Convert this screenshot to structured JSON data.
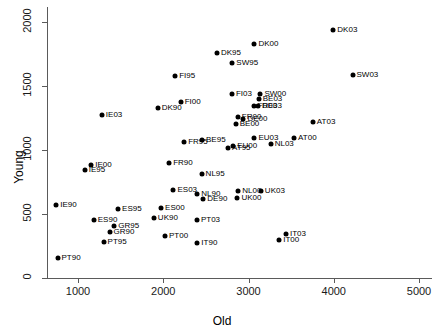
{
  "chart_data": {
    "type": "scatter",
    "title": "",
    "xlabel": "Old",
    "ylabel": "Young",
    "xlim": [
      500,
      5150
    ],
    "ylim": [
      -80,
      2120
    ],
    "grid": false,
    "legend": "none",
    "xticks": [
      1000,
      2000,
      3000,
      4000,
      5000
    ],
    "xticklabels": [
      "1000",
      "2000",
      "3000",
      "4000",
      "5000"
    ],
    "yticks": [
      0,
      500,
      1000,
      1500,
      2000
    ],
    "yticklabels": [
      "0",
      "500",
      "1000",
      "1500",
      "2000"
    ],
    "point_labels_position": "right",
    "points": [
      {
        "label": "PT90",
        "x": 760,
        "y": 160
      },
      {
        "label": "PT95",
        "x": 1300,
        "y": 280
      },
      {
        "label": "PT00",
        "x": 2020,
        "y": 330
      },
      {
        "label": "PT03",
        "x": 2395,
        "y": 455
      },
      {
        "label": "GR90",
        "x": 1370,
        "y": 360
      },
      {
        "label": "GR95",
        "x": 1425,
        "y": 405
      },
      {
        "label": "ES90",
        "x": 1185,
        "y": 455
      },
      {
        "label": "ES95",
        "x": 1470,
        "y": 540
      },
      {
        "label": "ES00",
        "x": 1975,
        "y": 545
      },
      {
        "label": "ES03",
        "x": 2120,
        "y": 690
      },
      {
        "label": "IE90",
        "x": 745,
        "y": 570
      },
      {
        "label": "IE95",
        "x": 1080,
        "y": 840
      },
      {
        "label": "IE00",
        "x": 1155,
        "y": 885
      },
      {
        "label": "IE03",
        "x": 1280,
        "y": 1270
      },
      {
        "label": "UK90",
        "x": 1890,
        "y": 470
      },
      {
        "label": "UK00",
        "x": 2870,
        "y": 625
      },
      {
        "label": "UK03",
        "x": 3145,
        "y": 680
      },
      {
        "label": "NL00",
        "x": 2880,
        "y": 680
      },
      {
        "label": "NL90",
        "x": 2400,
        "y": 660
      },
      {
        "label": "NL95",
        "x": 2450,
        "y": 810
      },
      {
        "label": "NL03",
        "x": 3260,
        "y": 1045
      },
      {
        "label": "DE90",
        "x": 2470,
        "y": 620
      },
      {
        "label": "DE00",
        "x": 2940,
        "y": 1245
      },
      {
        "label": "DE03",
        "x": 3110,
        "y": 1340
      },
      {
        "label": "BE00",
        "x": 2850,
        "y": 1205
      },
      {
        "label": "BE03",
        "x": 3120,
        "y": 1400
      },
      {
        "label": "FR90",
        "x": 2070,
        "y": 900
      },
      {
        "label": "FR95",
        "x": 2245,
        "y": 1065
      },
      {
        "label": "FR00",
        "x": 2875,
        "y": 1255
      },
      {
        "label": "FR03",
        "x": 3060,
        "y": 1345
      },
      {
        "label": "AT95",
        "x": 2760,
        "y": 1015
      },
      {
        "label": "AT00",
        "x": 3535,
        "y": 1090
      },
      {
        "label": "AT03",
        "x": 3755,
        "y": 1215
      },
      {
        "label": "EU00",
        "x": 2820,
        "y": 1035
      },
      {
        "label": "EU03",
        "x": 3070,
        "y": 1090
      },
      {
        "label": "IT90",
        "x": 2400,
        "y": 270
      },
      {
        "label": "IT00",
        "x": 3360,
        "y": 300
      },
      {
        "label": "IT03",
        "x": 3440,
        "y": 345
      },
      {
        "label": "FI00",
        "x": 2205,
        "y": 1375
      },
      {
        "label": "FI03",
        "x": 2805,
        "y": 1435
      },
      {
        "label": "FI95",
        "x": 2140,
        "y": 1580
      },
      {
        "label": "SW95",
        "x": 2810,
        "y": 1680
      },
      {
        "label": "SW00",
        "x": 3140,
        "y": 1440
      },
      {
        "label": "SW03",
        "x": 4220,
        "y": 1585
      },
      {
        "label": "BE95",
        "x": 2455,
        "y": 1080
      },
      {
        "label": "DK90",
        "x": 1935,
        "y": 1330
      },
      {
        "label": "DK95",
        "x": 2630,
        "y": 1755
      },
      {
        "label": "DK00",
        "x": 3070,
        "y": 1830
      },
      {
        "label": "DK03",
        "x": 3995,
        "y": 1935
      }
    ]
  },
  "colors": {
    "point": "#000000",
    "axis": "#5a5a5a",
    "text": "#000000",
    "background": "#ffffff"
  }
}
